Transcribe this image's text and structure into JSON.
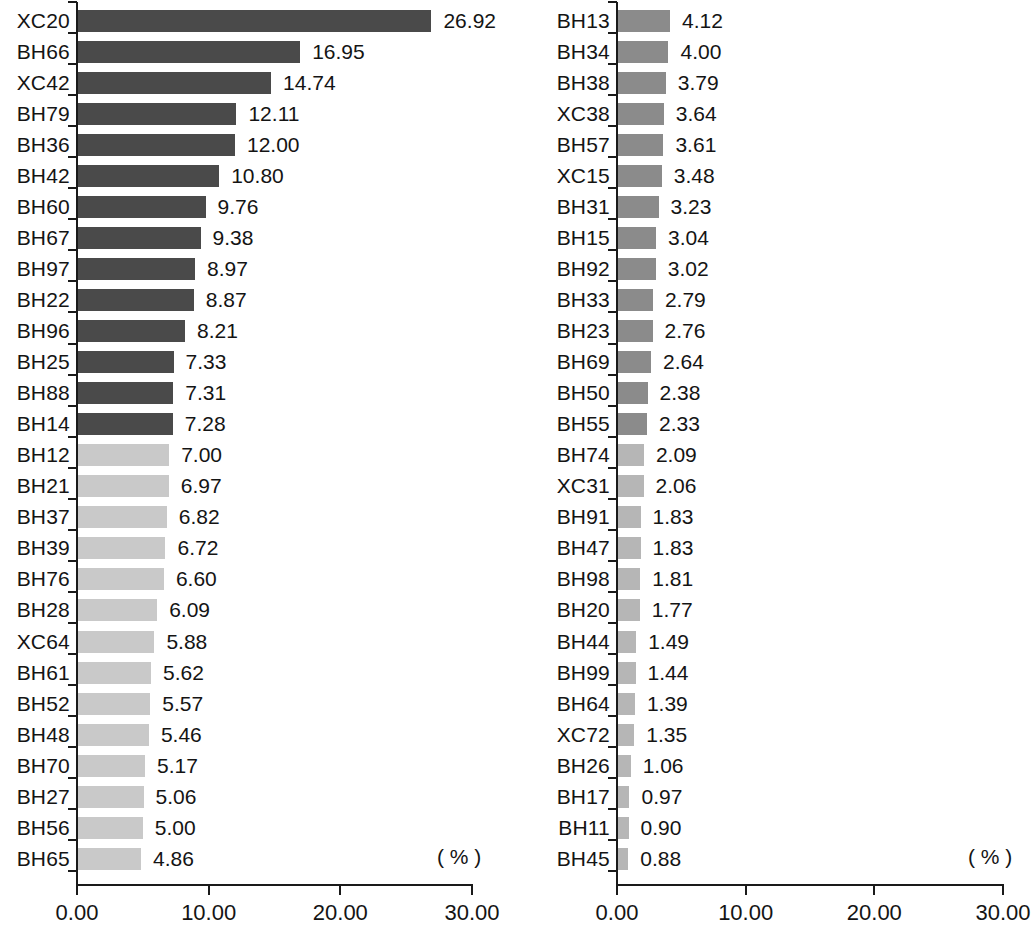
{
  "chart_data": {
    "type": "bar",
    "orientation": "horizontal",
    "title": "",
    "xlabel": "( % )",
    "ylabel": "",
    "xlim": [
      0,
      30
    ],
    "xticks": [
      0,
      10,
      20,
      30
    ],
    "xtick_labels": [
      "0.00",
      "10.00",
      "20.00",
      "30.00"
    ],
    "grid": false,
    "legend": "none",
    "panels": [
      {
        "name": "left-panel",
        "unit_label": "( % )",
        "categories": [
          "XC20",
          "BH66",
          "XC42",
          "BH79",
          "BH36",
          "BH42",
          "BH60",
          "BH67",
          "BH97",
          "BH22",
          "BH96",
          "BH25",
          "BH88",
          "BH14",
          "BH12",
          "BH21",
          "BH37",
          "BH39",
          "BH76",
          "BH28",
          "XC64",
          "BH61",
          "BH52",
          "BH48",
          "BH70",
          "BH27",
          "BH56",
          "BH65"
        ],
        "values": [
          26.92,
          16.95,
          14.74,
          12.11,
          12.0,
          10.8,
          9.76,
          9.38,
          8.97,
          8.87,
          8.21,
          7.33,
          7.31,
          7.28,
          7.0,
          6.97,
          6.82,
          6.72,
          6.6,
          6.09,
          5.88,
          5.62,
          5.57,
          5.46,
          5.17,
          5.06,
          5.0,
          4.86
        ],
        "value_labels": [
          "26.92",
          "16.95",
          "14.74",
          "12.11",
          "12.00",
          "10.80",
          "9.76",
          "9.38",
          "8.97",
          "8.87",
          "8.21",
          "7.33",
          "7.31",
          "7.28",
          "7.00",
          "6.97",
          "6.82",
          "6.72",
          "6.60",
          "6.09",
          "5.88",
          "5.62",
          "5.57",
          "5.46",
          "5.17",
          "5.06",
          "5.00",
          "4.86"
        ],
        "bar_colors": [
          "#4a4a4a",
          "#4a4a4a",
          "#4a4a4a",
          "#4a4a4a",
          "#4a4a4a",
          "#4a4a4a",
          "#4a4a4a",
          "#4a4a4a",
          "#4a4a4a",
          "#4a4a4a",
          "#4a4a4a",
          "#4a4a4a",
          "#4a4a4a",
          "#4a4a4a",
          "#c9c9c9",
          "#c9c9c9",
          "#c9c9c9",
          "#c9c9c9",
          "#c9c9c9",
          "#c9c9c9",
          "#c9c9c9",
          "#c9c9c9",
          "#c9c9c9",
          "#c9c9c9",
          "#c9c9c9",
          "#c9c9c9",
          "#c9c9c9",
          "#c9c9c9"
        ]
      },
      {
        "name": "right-panel",
        "unit_label": "( % )",
        "categories": [
          "BH13",
          "BH34",
          "BH38",
          "XC38",
          "BH57",
          "XC15",
          "BH31",
          "BH15",
          "BH92",
          "BH33",
          "BH23",
          "BH69",
          "BH50",
          "BH55",
          "BH74",
          "XC31",
          "BH91",
          "BH47",
          "BH98",
          "BH20",
          "BH44",
          "BH99",
          "BH64",
          "XC72",
          "BH26",
          "BH17",
          "BH11",
          "BH45"
        ],
        "values": [
          4.12,
          4.0,
          3.79,
          3.64,
          3.61,
          3.48,
          3.23,
          3.04,
          3.02,
          2.79,
          2.76,
          2.64,
          2.38,
          2.33,
          2.09,
          2.06,
          1.83,
          1.83,
          1.81,
          1.77,
          1.49,
          1.44,
          1.39,
          1.35,
          1.06,
          0.97,
          0.9,
          0.88
        ],
        "value_labels": [
          "4.12",
          "4.00",
          "3.79",
          "3.64",
          "3.61",
          "3.48",
          "3.23",
          "3.04",
          "3.02",
          "2.79",
          "2.76",
          "2.64",
          "2.38",
          "2.33",
          "2.09",
          "2.06",
          "1.83",
          "1.83",
          "1.81",
          "1.77",
          "1.49",
          "1.44",
          "1.39",
          "1.35",
          "1.06",
          "0.97",
          "0.90",
          "0.88"
        ],
        "bar_colors": [
          "#8b8b8b",
          "#8b8b8b",
          "#8b8b8b",
          "#8b8b8b",
          "#8b8b8b",
          "#8b8b8b",
          "#8b8b8b",
          "#8b8b8b",
          "#8b8b8b",
          "#8b8b8b",
          "#8b8b8b",
          "#8b8b8b",
          "#8b8b8b",
          "#8b8b8b",
          "#b6b6b6",
          "#b6b6b6",
          "#b6b6b6",
          "#b6b6b6",
          "#b6b6b6",
          "#b6b6b6",
          "#b6b6b6",
          "#b6b6b6",
          "#b6b6b6",
          "#b6b6b6",
          "#b6b6b6",
          "#b6b6b6",
          "#b6b6b6",
          "#b6b6b6"
        ]
      }
    ]
  },
  "colors": {
    "axis": "#1a1a1a",
    "text": "#141414",
    "background": "#ffffff",
    "bar_dark": "#4a4a4a",
    "bar_light": "#c9c9c9",
    "bar_medium": "#8b8b8b",
    "bar_pale": "#b6b6b6"
  }
}
